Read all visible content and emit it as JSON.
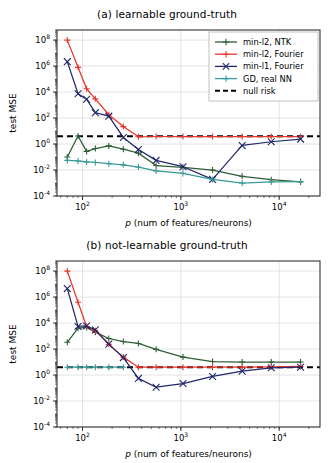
{
  "figure": {
    "width": 334,
    "height": 463,
    "background": "#ffffff"
  },
  "colors": {
    "min_l2_ntk": "#2e5d35",
    "min_l2_fourier": "#e8352b",
    "min_l1_fourier": "#22276b",
    "gd_real_nn": "#3a9a9a",
    "null_risk": "#000000",
    "grid": "#d8d8d8",
    "frame": "#333333"
  },
  "legend": {
    "position": "upper-right",
    "entries": [
      {
        "label": "min-l2, NTK",
        "color_key": "min_l2_ntk",
        "marker": "plus",
        "dashed": false
      },
      {
        "label": "min-l2, Fourier",
        "color_key": "min_l2_fourier",
        "marker": "plus",
        "dashed": false
      },
      {
        "label": "min-l1, Fourier",
        "color_key": "min_l1_fourier",
        "marker": "x",
        "dashed": false
      },
      {
        "label": "GD, real NN",
        "color_key": "gd_real_nn",
        "marker": "plus",
        "dashed": false
      },
      {
        "label": "null risk",
        "color_key": "null_risk",
        "marker": "none",
        "dashed": true
      }
    ]
  },
  "axes": {
    "xlabel": "p (num of features/neurons)",
    "xlabel_italic_prefix": "p",
    "xlabel_rest": " (num of features/neurons)",
    "ylabel": "test MSE",
    "xscale": "log",
    "yscale": "log",
    "xlim": [
      55,
      26000
    ],
    "ylim": [
      0.0001,
      600000000
    ],
    "xticks": [
      {
        "value": 100,
        "label": "10",
        "exp": "2"
      },
      {
        "value": 1000,
        "label": "10",
        "exp": "3"
      },
      {
        "value": 10000,
        "label": "10",
        "exp": "4"
      }
    ],
    "yticks": [
      {
        "value": 100000000,
        "label": "10",
        "exp": "8"
      },
      {
        "value": 1000000,
        "label": "10",
        "exp": "6"
      },
      {
        "value": 10000,
        "label": "10",
        "exp": "4"
      },
      {
        "value": 100,
        "label": "10",
        "exp": "2"
      },
      {
        "value": 1,
        "label": "10",
        "exp": "0"
      },
      {
        "value": 0.01,
        "label": "10",
        "exp": "-2"
      },
      {
        "value": 0.0001,
        "label": "10",
        "exp": "-4"
      }
    ],
    "grid": true
  },
  "chart_data": [
    {
      "id": "panel-a",
      "type": "line",
      "title": "(a) learnable ground-truth",
      "xlabel": "p (num of features/neurons)",
      "ylabel": "test MSE",
      "xscale": "log",
      "yscale": "log",
      "xlim": [
        55,
        26000
      ],
      "ylim": [
        0.0001,
        600000000
      ],
      "grid": true,
      "legend_position": "upper right",
      "annotations": [
        {
          "name": "null-risk-line",
          "type": "hline",
          "y": 4.0,
          "style": "dashed",
          "color": "#000000",
          "label": "null risk"
        }
      ],
      "series": [
        {
          "name": "min-l2, NTK",
          "color": "#2e5d35",
          "marker": "plus",
          "x": [
            70,
            90,
            110,
            135,
            185,
            260,
            370,
            560,
            1050,
            2100,
            4200,
            8300,
            16500
          ],
          "y": [
            0.1,
            4.2,
            0.27,
            0.45,
            0.72,
            0.4,
            0.2,
            0.022,
            0.016,
            0.01,
            0.0033,
            0.0018,
            0.0012
          ]
        },
        {
          "name": "min-l2, Fourier",
          "color": "#e8352b",
          "marker": "plus",
          "x": [
            70,
            90,
            110,
            135,
            185,
            260,
            370,
            560,
            1050,
            2100,
            4200,
            8300,
            16500
          ],
          "y": [
            100000000,
            800000,
            18000,
            3000,
            180,
            22,
            3.6,
            3.8,
            3.8,
            3.8,
            3.8,
            3.8,
            3.8
          ]
        },
        {
          "name": "min-l1, Fourier",
          "color": "#22276b",
          "marker": "x",
          "x": [
            70,
            90,
            110,
            135,
            185,
            260,
            370,
            560,
            1050,
            2100,
            4200,
            8300,
            16500
          ],
          "y": [
            2200000,
            7500,
            2800,
            260,
            140,
            3.2,
            0.38,
            0.055,
            0.018,
            0.0019,
            0.78,
            1.5,
            2.4
          ]
        },
        {
          "name": "GD, real NN",
          "color": "#3a9a9a",
          "marker": "plus",
          "x": [
            70,
            90,
            110,
            135,
            185,
            260,
            370,
            560,
            1050,
            2100,
            4200,
            8300,
            16500
          ],
          "y": [
            0.055,
            0.05,
            0.042,
            0.038,
            0.031,
            0.025,
            0.017,
            0.0085,
            0.0055,
            0.0019,
            0.001,
            0.0012,
            0.0013
          ]
        }
      ]
    },
    {
      "id": "panel-b",
      "type": "line",
      "title": "(b) not-learnable ground-truth",
      "xlabel": "p (num of features/neurons)",
      "ylabel": "test MSE",
      "xscale": "log",
      "yscale": "log",
      "xlim": [
        55,
        26000
      ],
      "ylim": [
        0.0001,
        600000000
      ],
      "grid": true,
      "legend_position": "none",
      "annotations": [
        {
          "name": "null-risk-line",
          "type": "hline",
          "y": 4.0,
          "style": "dashed",
          "color": "#000000",
          "label": "null risk"
        }
      ],
      "series": [
        {
          "name": "min-l2, NTK",
          "color": "#2e5d35",
          "marker": "plus",
          "x": [
            70,
            90,
            110,
            135,
            185,
            260,
            370,
            560,
            1050,
            2100,
            4200,
            8300,
            16500
          ],
          "y": [
            330,
            4000,
            4600,
            2000,
            650,
            380,
            270,
            95,
            24,
            11,
            10,
            10,
            10
          ]
        },
        {
          "name": "min-l2, Fourier",
          "color": "#e8352b",
          "marker": "plus",
          "x": [
            70,
            90,
            110,
            135,
            185,
            260,
            370,
            560,
            1050,
            2100,
            4200,
            8300,
            16500
          ],
          "y": [
            100000000,
            400000,
            5500,
            2600,
            230,
            24,
            4.0,
            4.0,
            4.0,
            4.0,
            4.0,
            4.3,
            4.6
          ]
        },
        {
          "name": "min-l1, Fourier",
          "color": "#22276b",
          "marker": "x",
          "x": [
            70,
            90,
            110,
            135,
            185,
            260,
            370,
            560,
            1050,
            2100,
            4200,
            8300,
            16500
          ],
          "y": [
            4500000,
            5500,
            6000,
            3000,
            240,
            22,
            0.55,
            0.115,
            0.22,
            0.78,
            2.0,
            3.6,
            4.0
          ]
        },
        {
          "name": "GD, real NN",
          "color": "#3a9a9a",
          "marker": "plus",
          "x": [
            70,
            90,
            110,
            135,
            185,
            260
          ],
          "y": [
            4.0,
            4.0,
            4.0,
            4.0,
            4.0,
            4.0
          ]
        }
      ]
    }
  ]
}
